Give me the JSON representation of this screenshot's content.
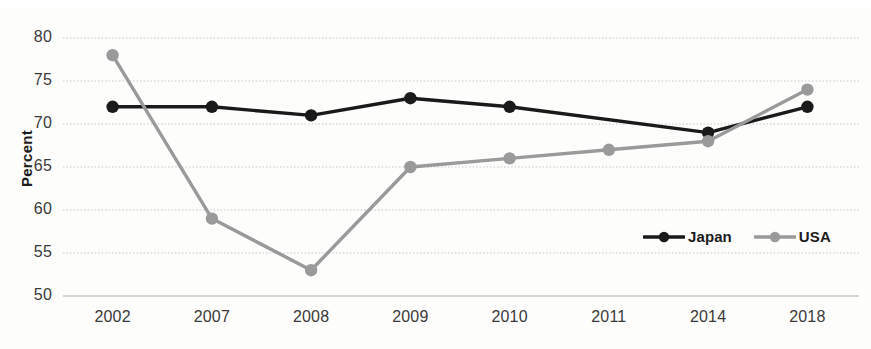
{
  "chart_data": {
    "type": "line",
    "title": "",
    "xlabel": "",
    "ylabel": "Percent",
    "categories": [
      "2002",
      "2007",
      "2008",
      "2009",
      "2010",
      "2011",
      "2014",
      "2018"
    ],
    "ylim": [
      50,
      80
    ],
    "yticks": [
      50,
      55,
      60,
      65,
      70,
      75,
      80
    ],
    "grid": true,
    "legend_position": "inside-lower-right",
    "series": [
      {
        "name": "Japan",
        "color": "#1a1a1a",
        "values": [
          72,
          72,
          71,
          73,
          72,
          null,
          69,
          72
        ],
        "markers": [
          true,
          true,
          true,
          true,
          true,
          false,
          true,
          true
        ]
      },
      {
        "name": "USA",
        "color": "#9a9a9a",
        "values": [
          78,
          59,
          53,
          65,
          66,
          67,
          68,
          74
        ],
        "markers": [
          true,
          true,
          true,
          true,
          true,
          true,
          true,
          true
        ]
      }
    ]
  },
  "axis": {
    "y_tick_labels": [
      "80",
      "75",
      "70",
      "65",
      "60",
      "55",
      "50"
    ],
    "x_tick_labels": [
      "2002",
      "2007",
      "2008",
      "2009",
      "2010",
      "2011",
      "2014",
      "2018"
    ],
    "y_axis_title": "Percent"
  },
  "legend": {
    "items": [
      {
        "label": "Japan",
        "color": "#1a1a1a",
        "marker": "circle-marker"
      },
      {
        "label": "USA",
        "color": "#9a9a9a",
        "marker": "circle-marker"
      }
    ]
  },
  "colors": {
    "japan": "#1a1a1a",
    "usa": "#9a9a9a",
    "gridline": "#c9c9c9",
    "text": "#3a3a3a",
    "background": "#fdfdfc"
  }
}
